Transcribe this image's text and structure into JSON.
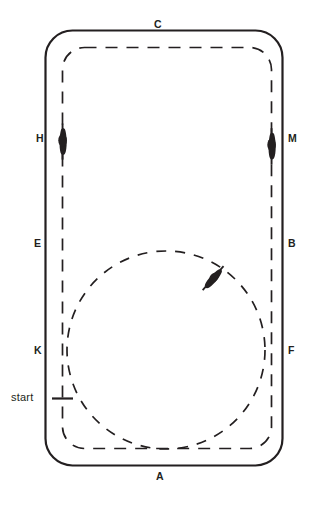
{
  "figure": {
    "type": "arena-diagram",
    "stroke_color": "#231f20",
    "background_color": "#ffffff"
  },
  "arena": {
    "outer_track_style": "solid",
    "inner_track_style": "dashed",
    "corner_style": "rounded"
  },
  "markers": [
    {
      "id": "C",
      "label": "C",
      "position": "top-center"
    },
    {
      "id": "M",
      "label": "M",
      "position": "right-upper"
    },
    {
      "id": "B",
      "label": "B",
      "position": "right-middle"
    },
    {
      "id": "F",
      "label": "F",
      "position": "right-lower"
    },
    {
      "id": "A",
      "label": "A",
      "position": "bottom-center"
    },
    {
      "id": "K",
      "label": "K",
      "position": "left-lower"
    },
    {
      "id": "E",
      "label": "E",
      "position": "left-middle"
    },
    {
      "id": "H",
      "label": "H",
      "position": "left-upper"
    }
  ],
  "annotations": {
    "start": {
      "label": "start",
      "position": "left-track-lower",
      "tick_mark": true
    }
  },
  "riders": [
    {
      "id": "rider-at-h",
      "description": "horse-and-rider-silhouette",
      "location": "left track beside H",
      "heading": "vertical"
    },
    {
      "id": "rider-at-m",
      "description": "horse-and-rider-silhouette",
      "location": "right track beside M",
      "heading": "vertical"
    },
    {
      "id": "rider-on-circle",
      "description": "horse-and-rider-silhouette",
      "location": "upper right of 20m circle",
      "heading": "diagonal"
    }
  ],
  "figures": {
    "circle": {
      "label": "20 metre circle",
      "style": "dashed",
      "tangent_points": [
        "A end of arena",
        "left track",
        "right track"
      ]
    }
  }
}
